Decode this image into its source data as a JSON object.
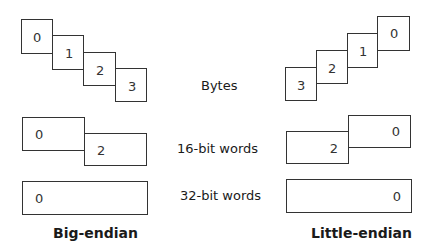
{
  "row_labels": {
    "bytes": "Bytes",
    "words16": "16-bit words",
    "words32": "32-bit words"
  },
  "big_endian": {
    "title": "Big-endian",
    "bytes": [
      "0",
      "1",
      "2",
      "3"
    ],
    "words16": [
      "0",
      "2"
    ],
    "words32": [
      "0"
    ]
  },
  "little_endian": {
    "title": "Little-endian",
    "bytes": [
      "0",
      "1",
      "2",
      "3"
    ],
    "words16": [
      "0",
      "2"
    ],
    "words32": [
      "0"
    ]
  }
}
